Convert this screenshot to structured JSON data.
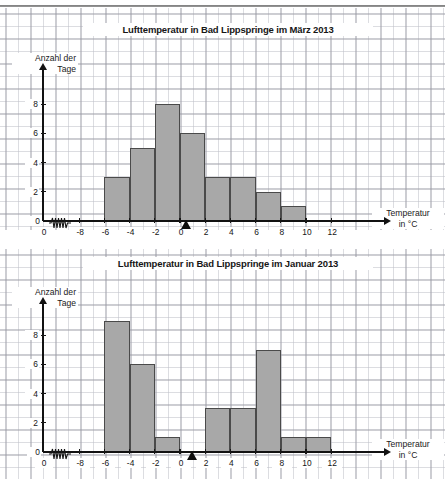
{
  "page": {
    "language": "de",
    "background_color": "#ffffff",
    "grid_paper": true,
    "bar_fill_color": "#a8a8a8",
    "bar_stroke_color": "#4a4a4a",
    "axis_color": "#121212"
  },
  "charts": [
    {
      "id": "maerz",
      "title": "Lufttemperatur in Bad Lippspringe im März 2013",
      "y_axis_label_line1": "Anzahl der",
      "y_axis_label_line2": "Tage",
      "x_axis_label_line1": "Temperatur",
      "x_axis_label_line2": "in °C",
      "origin_label": "0",
      "axis_break_symbol": "zigzag",
      "marker": "triangle",
      "marker_value": 0.5,
      "y_ticks": [
        0,
        2,
        4,
        6,
        8
      ],
      "x_ticks": [
        -8,
        -6,
        -4,
        -2,
        0,
        2,
        4,
        6,
        8,
        10,
        12
      ],
      "bars": [
        {
          "from": -6,
          "to": -4,
          "value": 3
        },
        {
          "from": -4,
          "to": -2,
          "value": 5
        },
        {
          "from": -2,
          "to": 0,
          "value": 8
        },
        {
          "from": 0,
          "to": 2,
          "value": 6
        },
        {
          "from": 2,
          "to": 4,
          "value": 3
        },
        {
          "from": 4,
          "to": 6,
          "value": 3
        },
        {
          "from": 6,
          "to": 8,
          "value": 2
        },
        {
          "from": 8,
          "to": 10,
          "value": 1
        }
      ]
    },
    {
      "id": "januar",
      "title": "Lufttemperatur in Bad Lippspringe im  Januar 2013",
      "y_axis_label_line1": "Anzahl der",
      "y_axis_label_line2": "Tage",
      "x_axis_label_line1": "Temperatur",
      "x_axis_label_line2": "in °C",
      "origin_label": "0",
      "axis_break_symbol": "zigzag",
      "marker": "triangle",
      "marker_value": 1,
      "y_ticks": [
        0,
        2,
        4,
        6,
        8
      ],
      "x_ticks": [
        -8,
        -6,
        -4,
        -2,
        0,
        2,
        4,
        6,
        8,
        10,
        12
      ],
      "bars": [
        {
          "from": -6,
          "to": -4,
          "value": 9
        },
        {
          "from": -4,
          "to": -2,
          "value": 6
        },
        {
          "from": -2,
          "to": 0,
          "value": 1
        },
        {
          "from": 2,
          "to": 4,
          "value": 3
        },
        {
          "from": 4,
          "to": 6,
          "value": 3
        },
        {
          "from": 6,
          "to": 8,
          "value": 7
        },
        {
          "from": 8,
          "to": 10,
          "value": 1
        },
        {
          "from": 10,
          "to": 12,
          "value": 1
        }
      ]
    }
  ],
  "chart_data": [
    {
      "type": "bar",
      "title": "Lufttemperatur in Bad Lippspringe im März 2013",
      "xlabel": "Temperatur in °C",
      "ylabel": "Anzahl der Tage",
      "categories": [
        "-6 bis -4",
        "-4 bis -2",
        "-2 bis 0",
        "0 bis 2",
        "2 bis 4",
        "4 bis 6",
        "6 bis 8",
        "8 bis 10"
      ],
      "bin_edges": [
        -6,
        -4,
        -2,
        0,
        2,
        4,
        6,
        8,
        10
      ],
      "values": [
        3,
        5,
        8,
        6,
        3,
        3,
        2,
        1
      ],
      "xlim": [
        -8,
        12
      ],
      "ylim": [
        0,
        9
      ],
      "x_ticks": [
        -8,
        -6,
        -4,
        -2,
        0,
        2,
        4,
        6,
        8,
        10,
        12
      ],
      "y_ticks": [
        0,
        2,
        4,
        6,
        8
      ],
      "grid": true,
      "legend": "none",
      "annotations": [
        "Dreieck-Markierung bei ca. 0,5 °C",
        "Achsenunterbrechung zwischen 0 und -8"
      ]
    },
    {
      "type": "bar",
      "title": "Lufttemperatur in Bad Lippspringe im  Januar 2013",
      "xlabel": "Temperatur in °C",
      "ylabel": "Anzahl der Tage",
      "categories": [
        "-6 bis -4",
        "-4 bis -2",
        "-2 bis 0",
        "0 bis 2",
        "2 bis 4",
        "4 bis 6",
        "6 bis 8",
        "8 bis 10",
        "10 bis 12"
      ],
      "bin_edges": [
        -6,
        -4,
        -2,
        0,
        2,
        4,
        6,
        8,
        10,
        12
      ],
      "values": [
        9,
        6,
        1,
        0,
        3,
        3,
        7,
        1,
        1
      ],
      "xlim": [
        -8,
        12
      ],
      "ylim": [
        0,
        9
      ],
      "x_ticks": [
        -8,
        -6,
        -4,
        -2,
        0,
        2,
        4,
        6,
        8,
        10,
        12
      ],
      "y_ticks": [
        0,
        2,
        4,
        6,
        8
      ],
      "grid": true,
      "legend": "none",
      "annotations": [
        "Dreieck-Markierung bei 1 °C",
        "Achsenunterbrechung zwischen 0 und -8"
      ]
    }
  ]
}
